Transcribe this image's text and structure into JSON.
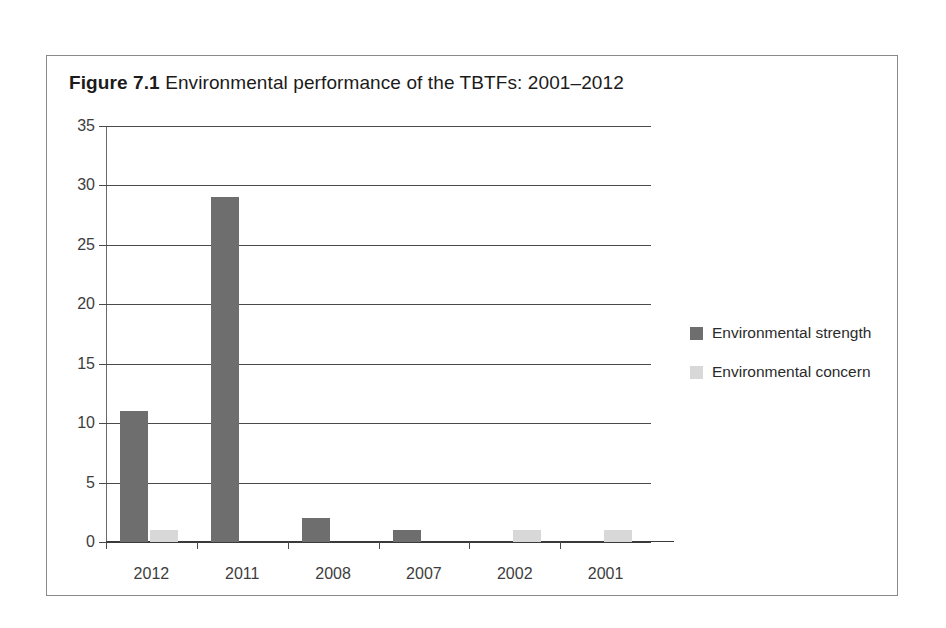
{
  "figure": {
    "label": "Figure 7.1",
    "caption": "Environmental performance of the TBTFs: 2001–2012"
  },
  "chart_data": {
    "type": "bar",
    "title": "Environmental performance of the TBTFs: 2001–2012",
    "xlabel": "",
    "ylabel": "",
    "categories": [
      "2012",
      "2011",
      "2008",
      "2007",
      "2002",
      "2001"
    ],
    "series": [
      {
        "name": "Environmental strength",
        "color": "#6e6e6e",
        "values": [
          11,
          29,
          2,
          1,
          0,
          0
        ]
      },
      {
        "name": "Environmental concern",
        "color": "#d8d8d8",
        "values": [
          1,
          0,
          0,
          0,
          1,
          1
        ]
      }
    ],
    "ylim": [
      0,
      35
    ],
    "yticks": [
      0,
      5,
      10,
      15,
      20,
      25,
      30,
      35
    ],
    "ytick_labels": [
      "0",
      "5",
      "10",
      "15",
      "20",
      "25",
      "30",
      "35"
    ],
    "grid": true,
    "grid_axis": "y",
    "legend_position": "right"
  },
  "legend": {
    "items": [
      {
        "label": "Environmental strength",
        "color": "#6e6e6e"
      },
      {
        "label": "Environmental concern",
        "color": "#d8d8d8"
      }
    ]
  },
  "colors": {
    "strength": "#6e6e6e",
    "concern": "#d8d8d8",
    "axis": "#4a4a4a",
    "frame": "#8a8a8a",
    "text": "#3d3d3d"
  }
}
